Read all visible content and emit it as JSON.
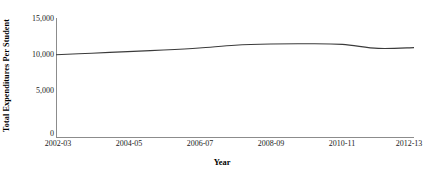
{
  "chart_data": {
    "type": "line",
    "title": "",
    "subtitle": "",
    "xlabel": "Year",
    "ylabel": "Total Expenditures Per Student",
    "x": [
      "2002-03",
      "2003-04",
      "2004-05",
      "2005-06",
      "2006-07",
      "2007-08",
      "2008-09",
      "2009-10",
      "2010-11",
      "2011-12",
      "2012-13"
    ],
    "categories": [
      "2002-03",
      "2003-04",
      "2004-05",
      "2005-06",
      "2006-07",
      "2007-08",
      "2008-09",
      "2009-10",
      "2010-11",
      "2011-12",
      "2012-13"
    ],
    "values": [
      10400,
      10600,
      10800,
      11000,
      11250,
      11600,
      11750,
      11780,
      11700,
      11200,
      11300
    ],
    "series": [
      {
        "name": "Total Expenditures Per Student",
        "values": [
          10400,
          10600,
          10800,
          11000,
          11250,
          11600,
          11750,
          11780,
          11700,
          11200,
          11300
        ],
        "color": "#3b3b3b"
      }
    ],
    "xlim": [
      0,
      10
    ],
    "ylim": [
      0,
      15000
    ],
    "y_ticks": [
      0,
      5000,
      10000,
      15000
    ],
    "y_tick_labels": [
      "0",
      "5,000",
      "10,000",
      "15,000"
    ],
    "x_ticks": [
      "2002-03",
      "2004-05",
      "2006-07",
      "2008-09",
      "2010-11",
      "2012-13"
    ],
    "x_tick_indices": [
      0,
      2,
      4,
      6,
      8,
      10
    ],
    "grid": false,
    "legend": "none",
    "line_color": "#3b3b3b",
    "axis_color": "#8c8c8c",
    "background": "#ffffff"
  },
  "axes": {
    "y_title": "Total Expenditures Per Student",
    "x_title": "Year",
    "y_labels": {
      "t0": "0",
      "t1": "5,000",
      "t2": "10,000",
      "t3": "15,000"
    },
    "x_labels": {
      "t0": "2002-03",
      "t1": "2004-05",
      "t2": "2006-07",
      "t3": "2008-09",
      "t4": "2010-11",
      "t5": "2012-13"
    }
  }
}
